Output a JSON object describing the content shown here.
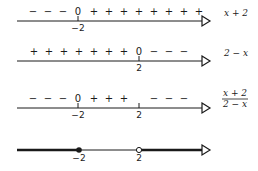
{
  "rows": [
    {
      "label": "x + 2",
      "line_y": 21,
      "signs": [
        "−",
        "−",
        "−",
        "0",
        "+",
        "+",
        "+",
        "+",
        "+",
        "+",
        "+",
        "+"
      ],
      "sign_x": [
        33,
        48,
        63,
        78,
        94,
        109,
        124,
        139,
        154,
        169,
        184,
        199
      ],
      "ticks": [
        {
          "x": 78,
          "label": "−2"
        }
      ]
    },
    {
      "label": "2 − x",
      "line_y": 61,
      "signs": [
        "+",
        "+",
        "+",
        "+",
        "+",
        "+",
        "+",
        "0",
        "−",
        "−",
        "−"
      ],
      "sign_x": [
        34,
        49,
        64,
        79,
        94,
        109,
        124,
        139,
        154,
        169,
        184
      ],
      "ticks": [
        {
          "x": 139,
          "label": "2"
        }
      ]
    },
    {
      "label_num": "x + 2",
      "label_den": "2 − x",
      "line_y": 108,
      "signs": [
        "−",
        "−",
        "−",
        "0",
        "+",
        "+",
        "+",
        "−",
        "−",
        "−"
      ],
      "sign_x": [
        33,
        48,
        63,
        78,
        94,
        109,
        124,
        154,
        169,
        184
      ],
      "ticks": [
        {
          "x": 78,
          "label": "−2"
        },
        {
          "x": 139,
          "label": "2"
        }
      ]
    },
    {
      "line_y": 150,
      "points": [
        {
          "x": 79,
          "label": "−2",
          "type": "filled"
        },
        {
          "x": 139,
          "label": "2",
          "type": "open"
        }
      ]
    }
  ],
  "axis": {
    "x_start": 17,
    "x_end": 210
  }
}
